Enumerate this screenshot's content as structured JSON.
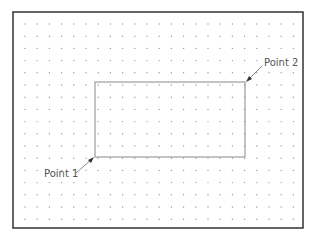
{
  "diagram": {
    "frame": {
      "x": 13,
      "y": 12,
      "w": 290,
      "h": 216,
      "color": "#333333"
    },
    "grid": {
      "x0": 25,
      "y0": 24,
      "step": 12.2,
      "cols": 23,
      "rows": 17,
      "dot_color": "#9a9a9a"
    },
    "rectangle": {
      "x1": 95,
      "y1": 82,
      "x2": 245,
      "y2": 157,
      "color": "#888888"
    },
    "labels": {
      "point1": "Point 1",
      "point2": "Point 2"
    }
  }
}
